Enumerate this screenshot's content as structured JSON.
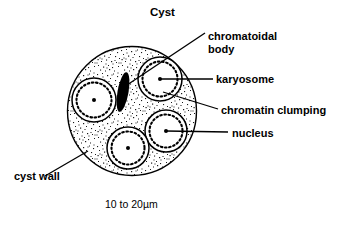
{
  "figure": {
    "title": "Cyst",
    "scale_label": "10 to 20µm",
    "background_color": "#ffffff",
    "ink_color": "#000000"
  },
  "labels": {
    "chromatoidal_body_line1": "chromatoidal",
    "chromatoidal_body_line2": "body",
    "karyosome": "karyosome",
    "chromatin_clumping": "chromatin clumping",
    "nucleus": "nucleus",
    "cyst_wall": "cyst wall"
  },
  "diagram": {
    "type": "labeled-biological-illustration",
    "cyst": {
      "center_x": 132,
      "center_y": 111,
      "radius": 65,
      "fill": "stipple",
      "stroke": "#000000"
    },
    "chromatoidal_body": {
      "shape": "elongated-rod",
      "fill": "#000000",
      "center_x": 123,
      "center_y": 92,
      "length": 40,
      "width": 11,
      "rotation_deg": 10
    },
    "nuclei": [
      {
        "id": "nucleus-left",
        "cx": 94,
        "cy": 100,
        "r": 22
      },
      {
        "id": "nucleus-top-right",
        "cx": 160,
        "cy": 79,
        "r": 22
      },
      {
        "id": "nucleus-bottom-right",
        "cx": 166,
        "cy": 131,
        "r": 21
      },
      {
        "id": "nucleus-bottom",
        "cx": 128,
        "cy": 148,
        "r": 21
      }
    ],
    "leader_lines": [
      {
        "id": "leader-chromatoidal-body",
        "x1": 205,
        "y1": 33,
        "x2": 127,
        "y2": 85
      },
      {
        "id": "leader-karyosome",
        "x1": 213,
        "y1": 79,
        "x2": 160,
        "y2": 79
      },
      {
        "id": "leader-chromatin-clumping",
        "x1": 218,
        "y1": 109,
        "x2": 163,
        "y2": 92
      },
      {
        "id": "leader-nucleus",
        "x1": 228,
        "y1": 132,
        "x2": 166,
        "y2": 131
      },
      {
        "id": "leader-cyst-wall",
        "x1": 45,
        "y1": 176,
        "x2": 88,
        "y2": 151
      }
    ]
  }
}
